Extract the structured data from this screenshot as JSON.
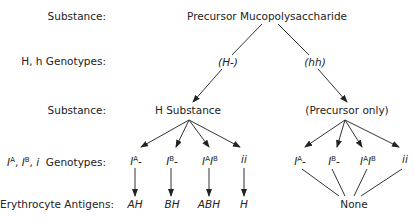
{
  "row_labels": {
    "substance_1": "Substance:",
    "h_genotypes": "H, h Genotypes:",
    "substance_2": "Substance:",
    "abo_genotypes": "Genotypes:",
    "abo_prefix": [
      "I",
      "A",
      ", ",
      "I",
      "B",
      ", ",
      "i"
    ],
    "antigens": "Erythrocyte Antigens:"
  },
  "top": {
    "substance": "Precursor Mucopolysaccharide"
  },
  "h_branch": {
    "left_genotype": "(H-)",
    "right_genotype": "(hh)"
  },
  "substances": {
    "left": "H Substance",
    "right": "(Precursor only)"
  },
  "left_genotypes": [
    {
      "base": "I",
      "sup": "A",
      "tail": "-"
    },
    {
      "base": "I",
      "sup": "B",
      "tail": "-"
    },
    {
      "base": "I",
      "sup": "A",
      "base2": "I",
      "sup2": "B"
    },
    {
      "text": "ii"
    }
  ],
  "right_genotypes": [
    {
      "base": "I",
      "sup": "A",
      "tail": "-"
    },
    {
      "base": "I",
      "sup": "B",
      "tail": "-"
    },
    {
      "base": "I",
      "sup": "A",
      "base2": "I",
      "sup2": "B"
    },
    {
      "text": "ii"
    }
  ],
  "antigens": {
    "left": [
      "AH",
      "BH",
      "ABH",
      "H"
    ],
    "right": "None"
  },
  "colors": {
    "ink": "#222222",
    "background": "#ffffff"
  }
}
